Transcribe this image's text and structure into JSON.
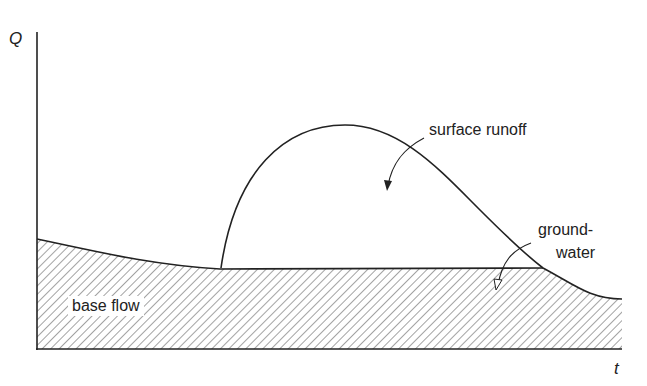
{
  "diagram": {
    "axes": {
      "y_label": "Q",
      "x_label": "t"
    },
    "labels": {
      "surface_runoff": "surface runoff",
      "groundwater_line1": "ground-",
      "groundwater_line2": "water",
      "base_flow": "base flow"
    },
    "colors": {
      "line": "#222222",
      "hatch": "#555555",
      "background": "#ffffff"
    }
  }
}
